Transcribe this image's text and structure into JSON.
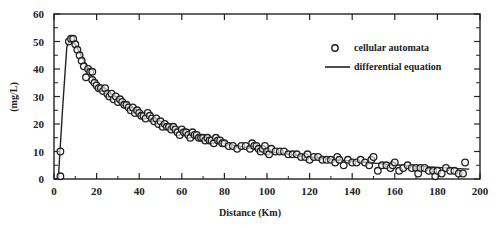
{
  "chart_data": {
    "type": "scatter",
    "title": "",
    "xlabel": "Distance (Km)",
    "ylabel": "(mg/L)",
    "xlim": [
      0,
      200
    ],
    "ylim": [
      0,
      60
    ],
    "x_ticks": [
      0,
      20,
      40,
      60,
      80,
      100,
      120,
      140,
      160,
      180,
      200
    ],
    "y_ticks": [
      0,
      10,
      20,
      30,
      40,
      50,
      60
    ],
    "grid": false,
    "legend_position": "upper right",
    "series": [
      {
        "name": "cellular automata",
        "style": "open-circle",
        "x": [
          3,
          3,
          7,
          8,
          9,
          10,
          11,
          12,
          13,
          14,
          15,
          16,
          17,
          18,
          18,
          19,
          20,
          21,
          22,
          23,
          24,
          25,
          26,
          27,
          28,
          29,
          30,
          31,
          32,
          33,
          34,
          35,
          36,
          37,
          38,
          39,
          40,
          41,
          42,
          43,
          44,
          45,
          46,
          47,
          48,
          49,
          50,
          51,
          52,
          53,
          54,
          55,
          56,
          57,
          58,
          59,
          60,
          61,
          62,
          63,
          64,
          65,
          66,
          67,
          68,
          69,
          70,
          71,
          72,
          73,
          74,
          75,
          76,
          77,
          78,
          79,
          80,
          82,
          84,
          86,
          88,
          90,
          92,
          93,
          94,
          95,
          96,
          97,
          98,
          99,
          100,
          101,
          102,
          104,
          106,
          108,
          110,
          112,
          114,
          116,
          118,
          119,
          120,
          122,
          124,
          126,
          128,
          130,
          132,
          133,
          134,
          136,
          138,
          140,
          142,
          144,
          146,
          148,
          149,
          150,
          152,
          154,
          156,
          158,
          159,
          160,
          162,
          164,
          166,
          168,
          170,
          171,
          172,
          174,
          176,
          178,
          179,
          180,
          182,
          184,
          186,
          188,
          190,
          192,
          193
        ],
        "y": [
          1,
          10,
          50,
          51,
          51,
          49,
          47,
          45,
          43,
          41,
          37,
          40,
          39,
          36,
          39,
          35,
          34,
          33,
          33,
          32,
          33,
          31,
          30,
          31,
          29,
          30,
          28,
          29,
          28,
          27,
          27,
          26,
          25,
          26,
          24,
          25,
          24,
          23,
          23,
          22,
          24,
          23,
          22,
          21,
          22,
          20,
          21,
          19,
          20,
          19,
          19,
          18,
          19,
          18,
          17,
          16,
          18,
          17,
          17,
          16,
          15,
          17,
          16,
          16,
          15,
          15,
          15,
          14,
          15,
          14,
          14,
          13,
          15,
          14,
          14,
          13,
          13,
          12,
          12,
          11,
          12,
          12,
          11,
          13,
          12,
          12,
          11,
          10,
          11,
          12,
          10,
          9,
          11,
          10,
          10,
          10,
          9,
          9,
          9,
          8,
          8,
          9,
          7,
          8,
          8,
          7,
          7,
          7,
          6,
          8,
          7,
          5,
          7,
          6,
          6,
          7,
          6,
          5,
          7,
          8,
          3,
          5,
          5,
          4,
          5,
          6,
          3,
          4,
          5,
          4,
          4,
          2,
          4,
          4,
          3,
          3,
          1,
          3,
          2,
          4,
          3,
          3,
          2,
          2,
          6
        ]
      },
      {
        "name": "differential equation",
        "style": "solid-line",
        "x": [
          0,
          2,
          4,
          6,
          7,
          8,
          10,
          12,
          14,
          16,
          18,
          20,
          25,
          30,
          35,
          40,
          45,
          50,
          55,
          60,
          65,
          70,
          75,
          80,
          90,
          100,
          110,
          120,
          130,
          140,
          150,
          160,
          170,
          180,
          190,
          195
        ],
        "y": [
          0,
          0,
          25,
          48,
          50,
          50,
          49,
          46,
          43,
          40,
          37,
          35,
          32,
          29,
          27,
          24.5,
          22.5,
          21,
          19,
          17.5,
          16,
          15,
          14,
          13,
          11.5,
          10,
          9,
          8,
          7.2,
          6.5,
          5.8,
          5.2,
          4.6,
          4.2,
          3.8,
          3.6
        ]
      }
    ]
  },
  "legend": {
    "items": [
      {
        "label": "cellular automata",
        "symbol": "circle"
      },
      {
        "label": "differential equation",
        "symbol": "line"
      }
    ]
  },
  "axes": {
    "x_title": "Distance (Km)",
    "y_title": "(mg/L)"
  },
  "colors": {
    "ink": "#222222",
    "background": "#ffffff"
  }
}
